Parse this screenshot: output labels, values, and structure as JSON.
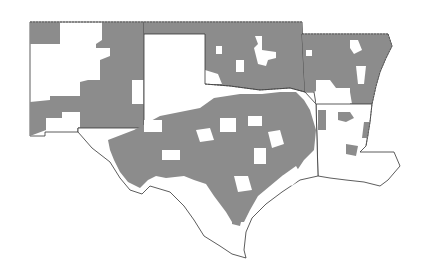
{
  "map": {
    "type": "choropleth",
    "region": "South-central United States",
    "states": [
      "New Mexico",
      "Oklahoma",
      "Texas",
      "Arkansas",
      "Louisiana"
    ],
    "colors": {
      "shaded": "#8c8c8c",
      "unshaded": "#ffffff",
      "border": "#333333"
    },
    "legend": null,
    "title": null
  }
}
